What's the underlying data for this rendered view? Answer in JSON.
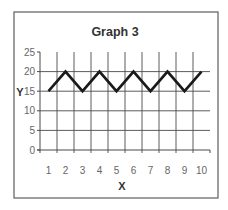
{
  "chart_data": {
    "type": "line",
    "title": "Graph 3",
    "xlabel": "X",
    "ylabel": "Y",
    "categories": [
      "1",
      "2",
      "3",
      "4",
      "5",
      "6",
      "7",
      "8",
      "9",
      "10"
    ],
    "x": [
      1,
      2,
      3,
      4,
      5,
      6,
      7,
      8,
      9,
      10
    ],
    "values": [
      15,
      20,
      15,
      20,
      15,
      20,
      15,
      20,
      15,
      20
    ],
    "series": [
      {
        "name": "Series 1",
        "values": [
          15,
          20,
          15,
          20,
          15,
          20,
          15,
          20,
          15,
          20
        ],
        "color": "#1a1a1a"
      }
    ],
    "ylim": [
      0,
      25
    ],
    "yticks": [
      0,
      5,
      10,
      15,
      20,
      25
    ],
    "grid": true,
    "legend": "none"
  }
}
